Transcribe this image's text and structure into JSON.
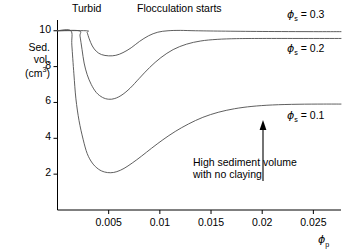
{
  "chart_data": {
    "type": "line",
    "title": "",
    "xlabel": "ϕp",
    "ylabel": "Sed. vol. (cm3)",
    "xlim": [
      0.0,
      0.0277
    ],
    "ylim": [
      0.0,
      10.6
    ],
    "grid": false,
    "legend_position": "right-inline",
    "xticks": [
      0.005,
      0.01,
      0.015,
      0.02,
      0.025
    ],
    "xtick_labels": [
      "0.005",
      "0.01",
      "0.015",
      "0.02",
      "0.025"
    ],
    "yticks": [
      2,
      4,
      6,
      8,
      10
    ],
    "ytick_labels": [
      "2",
      "4",
      "6",
      "8",
      "10"
    ],
    "series": [
      {
        "name": "ϕs = 0.3",
        "label_value": "0.3",
        "points": [
          [
            0.0,
            10.0
          ],
          [
            0.0028,
            10.0
          ],
          [
            0.0029,
            9.9
          ],
          [
            0.0031,
            9.55
          ],
          [
            0.0034,
            9.15
          ],
          [
            0.0038,
            8.85
          ],
          [
            0.0043,
            8.67
          ],
          [
            0.005,
            8.6
          ],
          [
            0.0057,
            8.63
          ],
          [
            0.0064,
            8.78
          ],
          [
            0.0072,
            9.05
          ],
          [
            0.008,
            9.4
          ],
          [
            0.0089,
            9.72
          ],
          [
            0.0098,
            9.92
          ],
          [
            0.0108,
            10.0
          ],
          [
            0.012,
            10.02
          ],
          [
            0.0135,
            10.0
          ],
          [
            0.016,
            9.98
          ],
          [
            0.02,
            9.96
          ],
          [
            0.025,
            9.95
          ],
          [
            0.0277,
            9.95
          ]
        ]
      },
      {
        "name": "ϕs = 0.2",
        "label_value": "0.2",
        "points": [
          [
            0.0,
            10.0
          ],
          [
            0.0021,
            10.0
          ],
          [
            0.0022,
            9.7
          ],
          [
            0.0024,
            8.95
          ],
          [
            0.0026,
            8.2
          ],
          [
            0.0029,
            7.55
          ],
          [
            0.0033,
            7.0
          ],
          [
            0.0038,
            6.55
          ],
          [
            0.0044,
            6.28
          ],
          [
            0.005,
            6.18
          ],
          [
            0.0056,
            6.22
          ],
          [
            0.0063,
            6.42
          ],
          [
            0.0071,
            6.8
          ],
          [
            0.008,
            7.35
          ],
          [
            0.009,
            7.95
          ],
          [
            0.0101,
            8.5
          ],
          [
            0.0113,
            8.95
          ],
          [
            0.0126,
            9.25
          ],
          [
            0.014,
            9.43
          ],
          [
            0.0156,
            9.52
          ],
          [
            0.0175,
            9.56
          ],
          [
            0.02,
            9.57
          ],
          [
            0.024,
            9.57
          ],
          [
            0.0277,
            9.57
          ]
        ]
      },
      {
        "name": "ϕs = 0.1",
        "label_value": "0.1",
        "points": [
          [
            0.0,
            10.0
          ],
          [
            0.0013,
            10.0
          ],
          [
            0.0014,
            9.2
          ],
          [
            0.0016,
            7.6
          ],
          [
            0.0018,
            6.2
          ],
          [
            0.0021,
            5.0
          ],
          [
            0.0025,
            3.95
          ],
          [
            0.0029,
            3.15
          ],
          [
            0.0034,
            2.62
          ],
          [
            0.004,
            2.28
          ],
          [
            0.0046,
            2.12
          ],
          [
            0.0052,
            2.08
          ],
          [
            0.0058,
            2.14
          ],
          [
            0.0065,
            2.32
          ],
          [
            0.0073,
            2.62
          ],
          [
            0.0082,
            3.0
          ],
          [
            0.0092,
            3.45
          ],
          [
            0.0103,
            3.92
          ],
          [
            0.0115,
            4.38
          ],
          [
            0.0128,
            4.8
          ],
          [
            0.0142,
            5.17
          ],
          [
            0.0157,
            5.45
          ],
          [
            0.0173,
            5.65
          ],
          [
            0.019,
            5.78
          ],
          [
            0.021,
            5.86
          ],
          [
            0.0235,
            5.9
          ],
          [
            0.026,
            5.91
          ],
          [
            0.0277,
            5.91
          ]
        ]
      }
    ],
    "annotations": [
      {
        "text": "Turbid",
        "x": 0.0026,
        "y": 10.45
      },
      {
        "text": "Flocculation starts",
        "x": 0.0112,
        "y": 10.45
      },
      {
        "text_line1": "High sediment volume",
        "text_line2": "with no claying",
        "x": 0.02,
        "y": 3.6
      }
    ]
  },
  "axes": {
    "y_title_line1": "Sed.",
    "y_title_line2": "vol.",
    "y_title_line3_pre": "(cm",
    "y_title_line3_sup": "3",
    "y_title_line3_post": ")",
    "x_title_phi": "ϕ",
    "x_title_sub": "p"
  },
  "series_labels": {
    "phi_symbol": "ϕ",
    "subscript": "s",
    "equals": " = ",
    "value_top": "0.3",
    "value_mid": "0.2",
    "value_bottom": "0.1"
  },
  "region_labels": {
    "turbid": "Turbid",
    "flocculation": "Flocculation starts"
  },
  "annotation": {
    "line1": "High sediment volume",
    "line2": "with no claying"
  },
  "colors": {
    "curve": "#4d4d4d",
    "axis": "#000000",
    "text": "#000000",
    "background": "#ffffff"
  }
}
